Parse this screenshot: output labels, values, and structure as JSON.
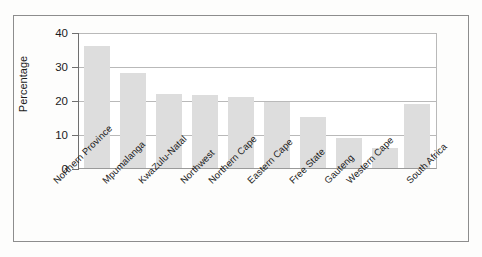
{
  "chart_data": {
    "type": "bar",
    "title": "",
    "xlabel": "",
    "ylabel": "Percentage",
    "ylim": [
      0,
      40
    ],
    "yticks": [
      0,
      10,
      20,
      30,
      40
    ],
    "ytick_labels": [
      "0",
      "10",
      "20",
      "30",
      "40"
    ],
    "grid": true,
    "legend": "none",
    "bar_color": "#dddddd",
    "categories": [
      "Northern Province",
      "Mpumalanga",
      "KwaZulu-Natal",
      "Northwest",
      "Northern Cape",
      "Eastern Cape",
      "Free State",
      "Gauteng",
      "Western Cape",
      "South Africa"
    ],
    "values": [
      36.3,
      28.5,
      22.0,
      21.7,
      21.2,
      19.8,
      15.2,
      9.0,
      6.1,
      19.0
    ]
  },
  "axis": {
    "y_title": "Percentage"
  }
}
